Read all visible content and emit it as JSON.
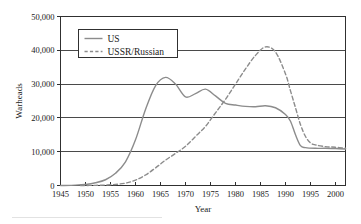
{
  "figure": {
    "caption_fragment": "",
    "background_color": "#ffffff",
    "line_color": "#8c8c8c",
    "axis_color": "#303030"
  },
  "chart_data": {
    "type": "line",
    "title": "",
    "xlabel": "Year",
    "ylabel": "Warheads",
    "xlim": [
      1945,
      2002
    ],
    "ylim": [
      0,
      50000
    ],
    "grid": true,
    "grid_axis": "y",
    "legend_position": "top-left",
    "xticks": [
      1945,
      1950,
      1955,
      1960,
      1965,
      1970,
      1975,
      1980,
      1985,
      1990,
      1995,
      2000
    ],
    "xtick_labels": [
      "1945",
      "1950",
      "1955",
      "1960",
      "1965",
      "1970",
      "1975",
      "1980",
      "1985",
      "1990",
      "1995",
      "2000"
    ],
    "yticks": [
      0,
      10000,
      20000,
      30000,
      40000,
      50000
    ],
    "ytick_labels": [
      "0",
      "10,000",
      "20,000",
      "30,000",
      "40,000",
      "50,000"
    ],
    "series": [
      {
        "name": "US",
        "style": "solid",
        "color": "#8c8c8c",
        "x": [
          1945,
          1948,
          1950,
          1952,
          1954,
          1956,
          1958,
          1960,
          1962,
          1964,
          1966,
          1968,
          1970,
          1972,
          1974,
          1976,
          1978,
          1980,
          1982,
          1984,
          1986,
          1988,
          1990,
          1991,
          1992,
          1993,
          1994,
          1996,
          1998,
          2000,
          2002
        ],
        "values": [
          0,
          100,
          300,
          800,
          1700,
          3600,
          7000,
          13500,
          22500,
          29500,
          32000,
          30000,
          26200,
          27200,
          28500,
          26500,
          24300,
          23800,
          23400,
          23300,
          23600,
          23000,
          21000,
          19000,
          15000,
          11800,
          11200,
          11000,
          11000,
          10900,
          10800
        ]
      },
      {
        "name": "USSR/Russian",
        "style": "dashed",
        "color": "#8c8c8c",
        "x": [
          1949,
          1952,
          1955,
          1958,
          1960,
          1962,
          1964,
          1966,
          1968,
          1970,
          1972,
          1974,
          1976,
          1978,
          1980,
          1982,
          1984,
          1986,
          1988,
          1990,
          1991,
          1992,
          1993,
          1994,
          1995,
          1996,
          1998,
          2000,
          2002
        ],
        "values": [
          0,
          50,
          200,
          700,
          1600,
          3100,
          5200,
          7500,
          9500,
          11600,
          14500,
          17500,
          21500,
          25500,
          30000,
          34500,
          38500,
          41000,
          39500,
          33000,
          28000,
          23000,
          18000,
          14500,
          12600,
          12000,
          11500,
          11300,
          11000
        ]
      }
    ],
    "legend": [
      {
        "label": "US",
        "style": "solid"
      },
      {
        "label": "USSR/Russian",
        "style": "dashed"
      }
    ]
  }
}
